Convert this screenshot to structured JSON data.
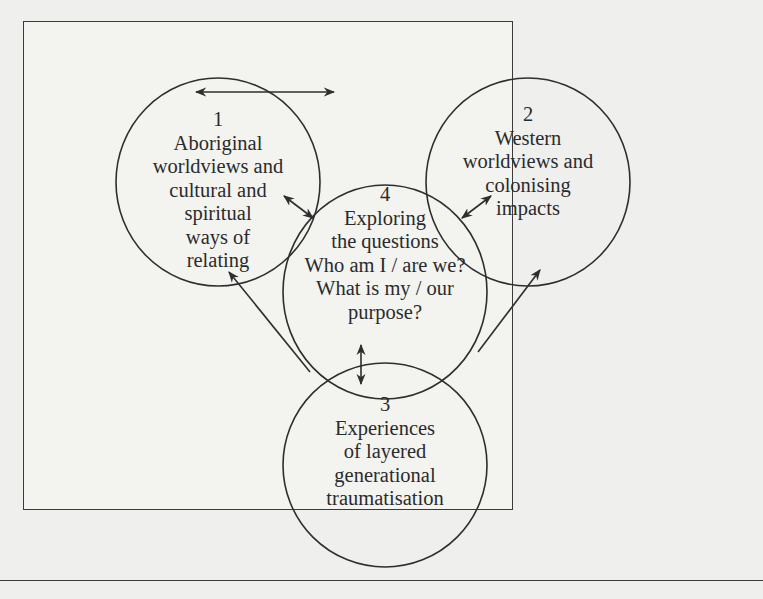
{
  "figure": {
    "type": "circle-relationship-diagram",
    "nodes": [
      {
        "id": "1",
        "number": "1",
        "lines": [
          "Aboriginal",
          "worldviews and",
          "cultural and",
          "spiritual",
          "ways of",
          "relating"
        ]
      },
      {
        "id": "2",
        "number": "2",
        "lines": [
          "Western",
          "worldviews and",
          "colonising",
          "impacts"
        ]
      },
      {
        "id": "3",
        "number": "3",
        "lines": [
          "Experiences",
          "of layered",
          "generational",
          "traumatisation"
        ]
      },
      {
        "id": "4",
        "number": "4",
        "lines": [
          "Exploring",
          "the questions",
          "Who am I / are we?",
          "What is my / our",
          "purpose?"
        ]
      }
    ],
    "edges": [
      {
        "from": "1",
        "to": "2",
        "type": "bidirectional"
      },
      {
        "from": "1",
        "to": "4",
        "type": "bidirectional"
      },
      {
        "from": "2",
        "to": "4",
        "type": "bidirectional"
      },
      {
        "from": "3",
        "to": "4",
        "type": "bidirectional"
      },
      {
        "from": "3",
        "to": "1",
        "type": "directed"
      },
      {
        "from": "3",
        "to": "2",
        "type": "directed"
      }
    ],
    "colors": {
      "stroke": "#2e2e2e",
      "background": "#efefed"
    }
  }
}
